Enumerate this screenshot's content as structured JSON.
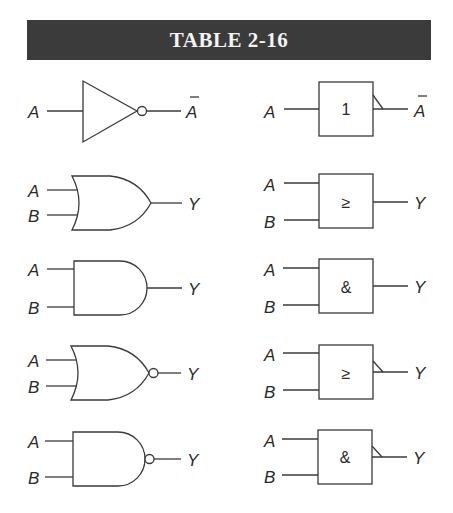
{
  "header": {
    "title": "TABLE 2-16"
  },
  "rows": [
    {
      "gate": "NOT",
      "distinctive": {
        "inputs": [
          "A"
        ],
        "output": "A",
        "output_overbar": true,
        "bubble": true
      },
      "rectangular": {
        "symbol": "1",
        "inputs": [
          "A"
        ],
        "output": "A",
        "output_overbar": true,
        "negation_flag": true
      }
    },
    {
      "gate": "OR",
      "distinctive": {
        "inputs": [
          "A",
          "B"
        ],
        "output": "Y",
        "bubble": false
      },
      "rectangular": {
        "symbol": "≥",
        "inputs": [
          "A",
          "B"
        ],
        "output": "Y",
        "negation_flag": false
      }
    },
    {
      "gate": "AND",
      "distinctive": {
        "inputs": [
          "A",
          "B"
        ],
        "output": "Y",
        "bubble": false
      },
      "rectangular": {
        "symbol": "&",
        "inputs": [
          "A",
          "B"
        ],
        "output": "Y",
        "negation_flag": false
      }
    },
    {
      "gate": "NOR",
      "distinctive": {
        "inputs": [
          "A",
          "B"
        ],
        "output": "Y",
        "bubble": true
      },
      "rectangular": {
        "symbol": "≥",
        "inputs": [
          "A",
          "B"
        ],
        "output": "Y",
        "negation_flag": true
      }
    },
    {
      "gate": "NAND",
      "distinctive": {
        "inputs": [
          "A",
          "B"
        ],
        "output": "Y",
        "bubble": true
      },
      "rectangular": {
        "symbol": "&",
        "inputs": [
          "A",
          "B"
        ],
        "output": "Y",
        "negation_flag": true
      }
    }
  ],
  "colors": {
    "header_bg": "#3b3b3b",
    "header_text": "#f4f4f4",
    "line": "#3a3a3a"
  }
}
